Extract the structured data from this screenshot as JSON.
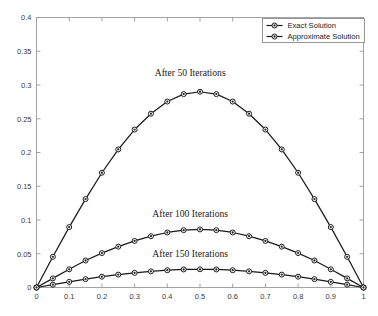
{
  "chart_data": {
    "type": "line",
    "title": "",
    "xlabel": "",
    "ylabel": "",
    "xlim": [
      0,
      1
    ],
    "ylim": [
      0,
      0.4
    ],
    "grid": false,
    "legend_position": "top-right",
    "x_ticks": [
      "0",
      "0.1",
      "0.2",
      "0.3",
      "0.4",
      "0.5",
      "0.6",
      "0.7",
      "0.8",
      "0.9",
      "1"
    ],
    "x_tick_values": [
      0,
      0.1,
      0.2,
      0.3,
      0.4,
      0.5,
      0.6,
      0.7,
      0.8,
      0.9,
      1
    ],
    "y_ticks": [
      "0",
      "0.05",
      "0.1",
      "0.15",
      "0.2",
      "0.25",
      "0.3",
      "0.35",
      "0.4"
    ],
    "y_tick_values": [
      0,
      0.05,
      0.1,
      0.15,
      0.2,
      0.25,
      0.3,
      0.35,
      0.4
    ],
    "x": [
      0,
      0.05,
      0.1,
      0.15,
      0.2,
      0.25,
      0.3,
      0.35,
      0.4,
      0.45,
      0.5,
      0.55,
      0.6,
      0.65,
      0.7,
      0.75,
      0.8,
      0.85,
      0.9,
      0.95,
      1
    ],
    "legend": [
      {
        "name": "Exact Solution",
        "marker": "circle-dot",
        "line": "solid"
      },
      {
        "name": "Approximate Solution",
        "marker": "circle-dot",
        "line": "solid"
      }
    ],
    "series": [
      {
        "name": "After 50 Iterations",
        "values": [
          0,
          0.0455,
          0.0895,
          0.131,
          0.17,
          0.2045,
          0.234,
          0.2575,
          0.2755,
          0.2865,
          0.29,
          0.2865,
          0.2755,
          0.2575,
          0.234,
          0.2045,
          0.17,
          0.131,
          0.0895,
          0.0455,
          0
        ]
      },
      {
        "name": "After 100 Iterations",
        "values": [
          0,
          0.0135,
          0.027,
          0.04,
          0.051,
          0.0605,
          0.069,
          0.076,
          0.0815,
          0.085,
          0.086,
          0.085,
          0.0815,
          0.076,
          0.069,
          0.0605,
          0.051,
          0.04,
          0.027,
          0.0135,
          0
        ]
      },
      {
        "name": "After 150 Iterations",
        "values": [
          0,
          0.0042,
          0.0084,
          0.0124,
          0.016,
          0.0191,
          0.0217,
          0.0239,
          0.0256,
          0.0267,
          0.027,
          0.0267,
          0.0256,
          0.0239,
          0.0217,
          0.0191,
          0.016,
          0.0124,
          0.0084,
          0.0042,
          0
        ]
      }
    ],
    "annotations": [
      {
        "text": "After 50 Iterations",
        "x": 0.47,
        "y": 0.313
      },
      {
        "text": "After 100 Iterations",
        "x": 0.47,
        "y": 0.104
      },
      {
        "text": "After 150 Iterations",
        "x": 0.47,
        "y": 0.0455
      }
    ]
  },
  "colors": {
    "background": "#ffffff",
    "axis": "#9a9a9a",
    "line": "#1a1a1a",
    "marker_fill": "#ffffff",
    "marker_dot": "#2b2b2b",
    "tick_text": "#3a3a3a"
  }
}
